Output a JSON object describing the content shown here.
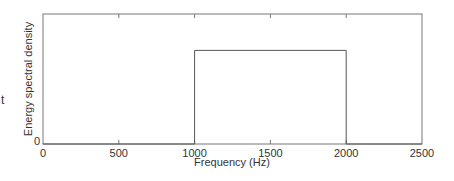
{
  "chart_data": {
    "type": "line",
    "title": "",
    "xlabel": "Frequency (Hz)",
    "ylabel": "Energy spectral density",
    "xlim": [
      0,
      2500
    ],
    "ylim": [
      0,
      1
    ],
    "xticks": [
      0,
      500,
      1000,
      1500,
      2000,
      2500
    ],
    "xtick_labels": [
      "0",
      "500",
      "1000",
      "1500",
      "2000",
      "2500"
    ],
    "yticks": [
      0
    ],
    "ytick_labels": [
      "0"
    ],
    "grid": false,
    "legend": null,
    "series": [
      {
        "name": "Energy spectral density",
        "shape": "rectangular band",
        "x": [
          0,
          1000,
          1000,
          2000,
          2000,
          2500
        ],
        "y": [
          0,
          0,
          0.72,
          0.72,
          0,
          0
        ],
        "color": "#555555"
      }
    ],
    "annotations": []
  },
  "edge_fragment": "t",
  "colors": {
    "axes": "#777777",
    "line": "#555555",
    "text": "#333333",
    "background": "#ffffff"
  }
}
